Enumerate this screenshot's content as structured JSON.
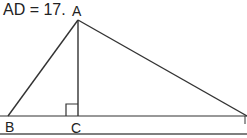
{
  "given": {
    "text": "AD = 17."
  },
  "points": {
    "A": {
      "label": "A",
      "x": 78,
      "y": 20
    },
    "B": {
      "label": "B",
      "x": 8,
      "y": 116
    },
    "C": {
      "label": "C",
      "x": 78,
      "y": 116
    },
    "D": {
      "label": "D",
      "x": 247,
      "y": 116
    }
  },
  "segments": [
    {
      "from": "A",
      "to": "B"
    },
    {
      "from": "A",
      "to": "C"
    },
    {
      "from": "A",
      "to": "D"
    },
    {
      "from": "B",
      "to": "D"
    }
  ],
  "right_angle_marker": {
    "at": "C",
    "size": 12
  },
  "colors": {
    "stroke": "#333333",
    "text": "#222222",
    "background": "#ffffff"
  }
}
